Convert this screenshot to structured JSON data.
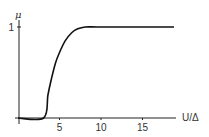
{
  "chart_data": {
    "type": "line",
    "title": "",
    "xlabel": "U/Δ",
    "ylabel": "μ",
    "xlim": [
      0,
      19
    ],
    "ylim": [
      0,
      1
    ],
    "xticks": [
      5,
      10,
      15
    ],
    "xtick_labels": [
      "5",
      "10",
      "15"
    ],
    "yticks": [
      1
    ],
    "ytick_labels": [
      "1"
    ],
    "grid": false,
    "legend": null,
    "series": [
      {
        "name": "μ",
        "color": "#111111",
        "x": [
          0,
          3.1,
          3.6,
          4.0,
          4.5,
          5.0,
          5.7,
          6.5,
          7.2,
          8.1,
          9.5,
          12,
          15,
          18.8
        ],
        "y": [
          0,
          0,
          0.25,
          0.42,
          0.6,
          0.72,
          0.85,
          0.94,
          0.98,
          1.0,
          1.0,
          1.0,
          1.0,
          1.0
        ]
      }
    ]
  }
}
